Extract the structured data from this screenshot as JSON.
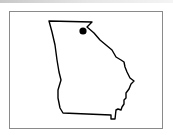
{
  "map": {
    "region": "Georgia",
    "marker": {
      "icon": "location-dot-icon",
      "color": "#000000"
    },
    "outline_color": "#000000",
    "frame_border_color": "#8a8a8a"
  }
}
